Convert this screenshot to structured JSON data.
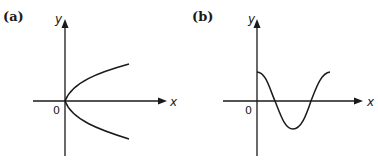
{
  "figure": {
    "panels": [
      {
        "id": "a",
        "label": "(a)",
        "x_axis_label": "x",
        "y_axis_label": "y",
        "origin_label": "0",
        "curve": "sideways parabola opening right (x = y^2), vertex at origin"
      },
      {
        "id": "b",
        "label": "(b)",
        "x_axis_label": "x",
        "y_axis_label": "y",
        "origin_label": "0",
        "curve": "cosine wave starting at positive maximum on y-axis, one full period"
      }
    ],
    "colors": {
      "ink": "#1a1a1a",
      "background": "#ffffff"
    }
  }
}
